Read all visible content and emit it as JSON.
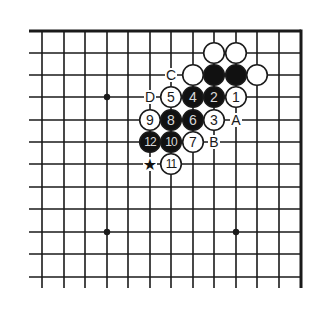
{
  "diagram": {
    "type": "go-board-problem",
    "grid": {
      "columns_x": [
        42,
        64,
        85,
        107,
        128,
        150,
        171,
        193,
        214,
        236,
        257,
        279,
        301
      ],
      "rows_y": [
        31,
        53,
        75,
        97,
        120,
        142,
        164,
        187,
        209,
        232,
        254,
        277
      ],
      "left_extend_x": 29,
      "bottom_extend_y": 288,
      "edges": [
        "top",
        "right"
      ],
      "line_color": "#1a1a1a"
    },
    "star_points": [
      {
        "col": 3,
        "row": 3
      },
      {
        "col": 3,
        "row": 9
      },
      {
        "col": 9,
        "row": 9
      }
    ],
    "stones": [
      {
        "col": 8,
        "row": 1,
        "color": "white",
        "label": ""
      },
      {
        "col": 9,
        "row": 1,
        "color": "white",
        "label": ""
      },
      {
        "col": 7,
        "row": 2,
        "color": "white",
        "label": ""
      },
      {
        "col": 8,
        "row": 2,
        "color": "black",
        "label": ""
      },
      {
        "col": 9,
        "row": 2,
        "color": "black",
        "label": ""
      },
      {
        "col": 10,
        "row": 2,
        "color": "white",
        "label": ""
      },
      {
        "col": 9,
        "row": 3,
        "color": "white",
        "label": "1"
      },
      {
        "col": 8,
        "row": 3,
        "color": "black",
        "label": "2"
      },
      {
        "col": 8,
        "row": 4,
        "color": "white",
        "label": "3"
      },
      {
        "col": 7,
        "row": 3,
        "color": "black",
        "label": "4"
      },
      {
        "col": 6,
        "row": 3,
        "color": "white",
        "label": "5"
      },
      {
        "col": 7,
        "row": 4,
        "color": "black",
        "label": "6"
      },
      {
        "col": 7,
        "row": 5,
        "color": "white",
        "label": "7"
      },
      {
        "col": 6,
        "row": 4,
        "color": "black",
        "label": "8"
      },
      {
        "col": 5,
        "row": 4,
        "color": "white",
        "label": "9"
      },
      {
        "col": 6,
        "row": 5,
        "color": "black",
        "label": "10"
      },
      {
        "col": 6,
        "row": 6,
        "color": "white",
        "label": "11"
      },
      {
        "col": 5,
        "row": 5,
        "color": "black",
        "label": "12"
      }
    ],
    "letter_marks": [
      {
        "col": 6,
        "row": 2,
        "text": "C"
      },
      {
        "col": 5,
        "row": 3,
        "text": "D"
      },
      {
        "col": 9,
        "row": 4,
        "text": "A"
      },
      {
        "col": 8,
        "row": 5,
        "text": "B"
      }
    ],
    "symbol_marks": [
      {
        "col": 5,
        "row": 6,
        "symbol": "★",
        "name": "star-mark"
      }
    ],
    "colors": {
      "black_stone": "#111111",
      "white_stone": "#ffffff",
      "stone_outline": "#1a1a1a",
      "background": "#ffffff"
    }
  }
}
